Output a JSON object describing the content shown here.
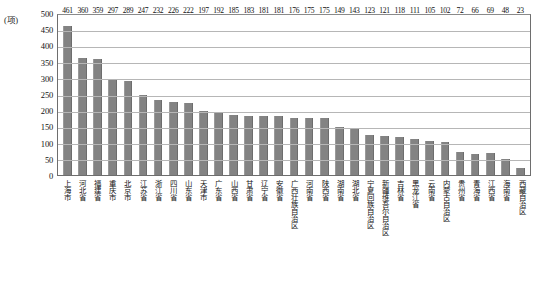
{
  "chart_data": {
    "type": "bar",
    "title": "",
    "subtitle": "",
    "xlabel": "",
    "ylabel": "(项)",
    "unit_label": "(项)",
    "ylim": [
      0,
      500
    ],
    "ytick_step": 50,
    "yticks": [
      "500",
      "450",
      "400",
      "350",
      "300",
      "250",
      "200",
      "150",
      "100",
      "50",
      "0"
    ],
    "grid": true,
    "grid_axis": "y",
    "legend": false,
    "bar_color": "#838383",
    "categories": [
      "上海市",
      "河北省",
      "福建省",
      "重庆市",
      "北京市",
      "江苏省",
      "浙江省",
      "四川省",
      "山东省",
      "天津市",
      "广东省",
      "山西省",
      "甘肃省",
      "辽宁省",
      "安徽省",
      "广西壮族自治区",
      "河南省",
      "陕西省",
      "湖南省",
      "湖北省",
      "宁夏回族自治区",
      "新疆维吾尔自治区",
      "吉林省",
      "黑龙江省",
      "云南省",
      "内蒙古自治区",
      "贵州省",
      "青海省",
      "江西省",
      "海南省",
      "西藏自治区"
    ],
    "values": [
      461,
      360,
      359,
      297,
      289,
      247,
      232,
      226,
      222,
      197,
      192,
      185,
      183,
      181,
      181,
      176,
      175,
      175,
      149,
      143,
      123,
      121,
      118,
      111,
      105,
      102,
      72,
      66,
      69,
      48,
      23
    ]
  }
}
